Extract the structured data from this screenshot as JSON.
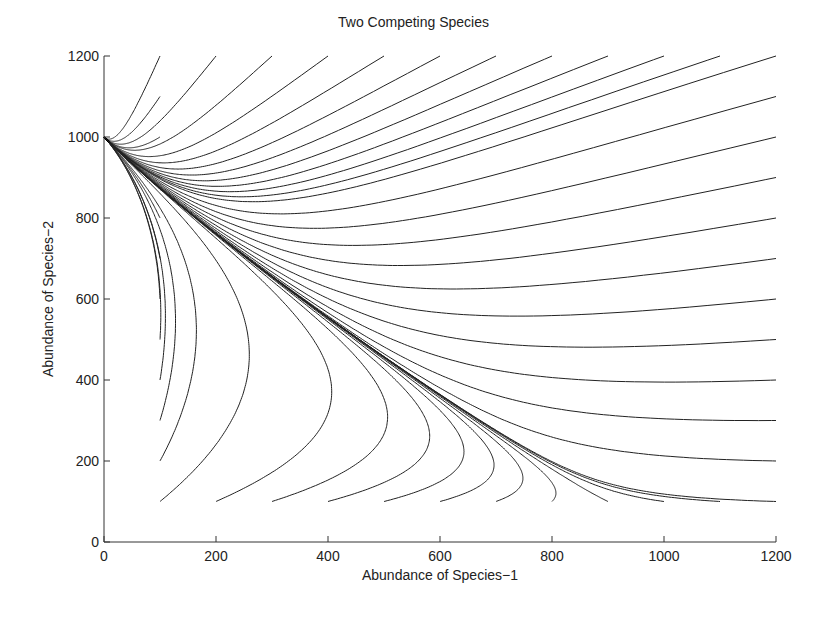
{
  "chart_data": {
    "type": "line",
    "title": "Two Competing Species",
    "xlabel": "Abundance of Species−1",
    "ylabel": "Abundance of Species−2",
    "xlim": [
      0,
      1200
    ],
    "ylim": [
      0,
      1200
    ],
    "xticks": [
      0,
      200,
      400,
      600,
      800,
      1000,
      1200
    ],
    "yticks": [
      0,
      200,
      400,
      600,
      800,
      1000,
      1200
    ],
    "grid": false,
    "legend": null,
    "equilibrium": [
      0,
      1000
    ],
    "initial_points": {
      "bottom_row_y100": [
        [
          100,
          100
        ],
        [
          200,
          100
        ],
        [
          300,
          100
        ],
        [
          400,
          100
        ],
        [
          500,
          100
        ],
        [
          600,
          100
        ],
        [
          700,
          100
        ],
        [
          800,
          100
        ],
        [
          900,
          100
        ],
        [
          1000,
          100
        ],
        [
          1100,
          100
        ],
        [
          1200,
          100
        ]
      ],
      "left_column_x100": [
        [
          100,
          200
        ],
        [
          100,
          300
        ],
        [
          100,
          400
        ],
        [
          100,
          500
        ],
        [
          100,
          600
        ],
        [
          100,
          700
        ],
        [
          100,
          800
        ],
        [
          100,
          900
        ],
        [
          100,
          1000
        ],
        [
          100,
          1100
        ],
        [
          100,
          1200
        ]
      ],
      "top_row_y1200": [
        [
          200,
          1200
        ],
        [
          300,
          1200
        ],
        [
          400,
          1200
        ],
        [
          500,
          1200
        ],
        [
          600,
          1200
        ],
        [
          700,
          1200
        ],
        [
          800,
          1200
        ],
        [
          900,
          1200
        ],
        [
          1000,
          1200
        ],
        [
          1100,
          1200
        ]
      ],
      "right_column_x1200": [
        [
          1200,
          200
        ],
        [
          1200,
          300
        ],
        [
          1200,
          400
        ],
        [
          1200,
          500
        ],
        [
          1200,
          600
        ],
        [
          1200,
          700
        ],
        [
          1200,
          800
        ],
        [
          1200,
          900
        ],
        [
          1200,
          1000
        ],
        [
          1200,
          1100
        ],
        [
          1200,
          1200
        ]
      ]
    },
    "line_color": "#222222"
  },
  "labels": {
    "title": "Two Competing Species",
    "xlabel": "Abundance of Species−1",
    "ylabel": "Abundance of Species−2"
  }
}
